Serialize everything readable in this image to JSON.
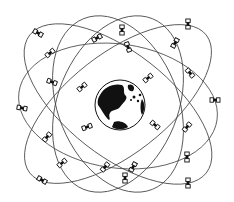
{
  "diagram": {
    "colors": {
      "background": "#ffffff",
      "line": "#444444",
      "ink": "#111111"
    },
    "earth": {
      "cx": 120,
      "cy": 105,
      "r": 25,
      "label": ""
    },
    "orbits": [
      {
        "cx": 118,
        "cy": 106,
        "rx": 100,
        "ry": 62,
        "rot": 8
      },
      {
        "cx": 118,
        "cy": 104,
        "rx": 112,
        "ry": 52,
        "rot": 38
      },
      {
        "cx": 118,
        "cy": 104,
        "rx": 112,
        "ry": 50,
        "rot": -38
      },
      {
        "cx": 118,
        "cy": 104,
        "rx": 92,
        "ry": 60,
        "rot": 68
      },
      {
        "cx": 118,
        "cy": 104,
        "rx": 92,
        "ry": 60,
        "rot": -68
      }
    ],
    "satellites": [
      {
        "x": 38,
        "y": 33,
        "rot": 30
      },
      {
        "x": 97,
        "y": 38,
        "rot": -30
      },
      {
        "x": 122,
        "y": 30,
        "rot": 90
      },
      {
        "x": 188,
        "y": 24,
        "rot": 90
      },
      {
        "x": 50,
        "y": 53,
        "rot": -40
      },
      {
        "x": 128,
        "y": 47,
        "rot": 70
      },
      {
        "x": 175,
        "y": 43,
        "rot": -60
      },
      {
        "x": 52,
        "y": 82,
        "rot": 20
      },
      {
        "x": 82,
        "y": 87,
        "rot": -40
      },
      {
        "x": 148,
        "y": 78,
        "rot": -40
      },
      {
        "x": 190,
        "y": 73,
        "rot": 50
      },
      {
        "x": 22,
        "y": 108,
        "rot": 10
      },
      {
        "x": 215,
        "y": 100,
        "rot": 0
      },
      {
        "x": 87,
        "y": 127,
        "rot": -20
      },
      {
        "x": 155,
        "y": 125,
        "rot": 40
      },
      {
        "x": 187,
        "y": 127,
        "rot": -50
      },
      {
        "x": 47,
        "y": 137,
        "rot": -50
      },
      {
        "x": 62,
        "y": 163,
        "rot": -40
      },
      {
        "x": 105,
        "y": 167,
        "rot": -50
      },
      {
        "x": 133,
        "y": 167,
        "rot": -60
      },
      {
        "x": 187,
        "y": 157,
        "rot": 90
      },
      {
        "x": 42,
        "y": 180,
        "rot": 30
      },
      {
        "x": 125,
        "y": 178,
        "rot": 90
      },
      {
        "x": 188,
        "y": 183,
        "rot": 90
      }
    ]
  }
}
